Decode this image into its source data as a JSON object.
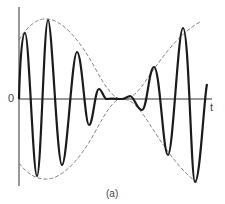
{
  "figure": {
    "caption": "(a)",
    "axis": {
      "origin_label": "0",
      "x_label": "t"
    },
    "colors": {
      "signal": "#1a1a1a",
      "envelope": "#777777",
      "axis": "#333333"
    }
  }
}
